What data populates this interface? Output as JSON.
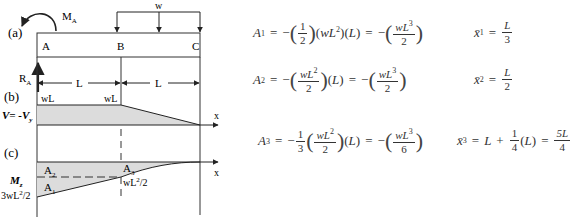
{
  "diagram": {
    "panel_labels": [
      "(a)",
      "(b)",
      "(c)"
    ],
    "beam": {
      "points": [
        "A",
        "B",
        "C"
      ],
      "moment_label": "M",
      "moment_sub": "A",
      "reaction_label": "R",
      "reaction_sub": "A",
      "load_label": "w",
      "span_labels": [
        "L",
        "L"
      ]
    },
    "shear": {
      "axis_label": "V= -V",
      "axis_sub": "y",
      "x_label": "x",
      "value_labels": [
        "wL",
        "wL"
      ]
    },
    "moment": {
      "axis_label": "M",
      "axis_sub": "z",
      "x_label": "x",
      "area_labels": [
        "A",
        "A",
        "A"
      ],
      "area_subs": [
        "1",
        "2",
        "3"
      ],
      "value_left": "3wL",
      "value_left_sup": "2",
      "value_left_tail": "/2",
      "value_mid": "wL",
      "value_mid_sup": "2",
      "value_mid_tail": "/2"
    },
    "colors": {
      "fill": "#d9d9d9",
      "line": "#222222"
    }
  },
  "equations": [
    {
      "lhs": "A",
      "lhs_sub": "1",
      "expr": "= −(1/2)(wL²)(L) = −(wL³/2)",
      "centroid": "x̄",
      "centroid_sub": "1",
      "centroid_val_num": "L",
      "centroid_val_den": "3"
    },
    {
      "lhs": "A",
      "lhs_sub": "2",
      "expr": "= −(wL²/2)(L) = −(wL³/2)",
      "centroid": "x̄",
      "centroid_sub": "2",
      "centroid_val_num": "L",
      "centroid_val_den": "2"
    },
    {
      "lhs": "A",
      "lhs_sub": "3",
      "expr": "= −1/3(wL²/2)(L) = −(wL³/6)",
      "centroid": "x̄",
      "centroid_sub": "3",
      "centroid_expr": "= L + 1/4(L) = 5L/4"
    }
  ],
  "eqtext": {
    "eq": "=",
    "minus": "−",
    "one": "1",
    "two": "2",
    "three": "3",
    "four": "4",
    "six": "6",
    "wL2": "wL",
    "wL3": "wL",
    "sup2": "2",
    "sup3": "3",
    "wL": "wL",
    "L": "L",
    "lparen": "(",
    "rparen": ")",
    "Lparen": "(L)",
    "plus": "+",
    "fiveL": "5L"
  }
}
